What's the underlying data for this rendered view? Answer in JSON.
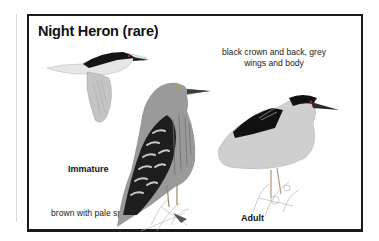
{
  "card": {
    "title": "Night Heron (rare)",
    "adult_description_line1": "black crown and back, grey",
    "adult_description_line2": "wings and body",
    "immature_label": "Immature",
    "immature_description": "brown with pale spots",
    "adult_label": "Adult"
  },
  "illustrations": [
    {
      "name": "flying-adult-heron",
      "pose": "in flight"
    },
    {
      "name": "immature-heron",
      "pose": "perched, streaked brown"
    },
    {
      "name": "adult-heron",
      "pose": "perched, black crown and back"
    }
  ],
  "colors": {
    "frame": "#1a1a1a",
    "background": "#ffffff",
    "text": "#111111"
  }
}
